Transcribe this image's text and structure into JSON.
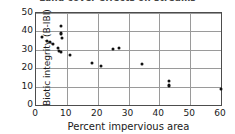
{
  "figure": {
    "title_partial": "Land cover effects on streams",
    "background_color": "#ffffff",
    "marker_color": "#111111",
    "axis_color": "#4d4d4d",
    "grid_color": "#9a9a9a"
  },
  "chart_data": {
    "type": "scatter",
    "title": "Land cover effects on streams",
    "xlabel": "Percent impervious area",
    "ylabel": "Biotic integrity (B-IBI)",
    "xlim": [
      0,
      60
    ],
    "ylim": [
      0,
      50
    ],
    "xticks": [
      0,
      10,
      20,
      30,
      40,
      50,
      60
    ],
    "yticks": [
      0,
      10,
      20,
      30,
      40,
      50
    ],
    "grid": true,
    "legend": null,
    "series": [
      {
        "name": "Stream sites",
        "points": [
          [
            2.0,
            37.0
          ],
          [
            3.5,
            35.0
          ],
          [
            4.5,
            34.0
          ],
          [
            5.5,
            33.0
          ],
          [
            7.0,
            31.0
          ],
          [
            7.5,
            29.5
          ],
          [
            8.0,
            29.0
          ],
          [
            8.0,
            43.0
          ],
          [
            8.0,
            39.0
          ],
          [
            8.2,
            38.5
          ],
          [
            8.5,
            36.5
          ],
          [
            11.0,
            27.0
          ],
          [
            18.0,
            23.0
          ],
          [
            21.0,
            21.0
          ],
          [
            25.0,
            30.5
          ],
          [
            27.0,
            31.0
          ],
          [
            34.5,
            22.5
          ],
          [
            43.0,
            13.0
          ],
          [
            43.0,
            11.0
          ],
          [
            43.0,
            10.5
          ],
          [
            60.0,
            8.5
          ]
        ]
      }
    ]
  }
}
